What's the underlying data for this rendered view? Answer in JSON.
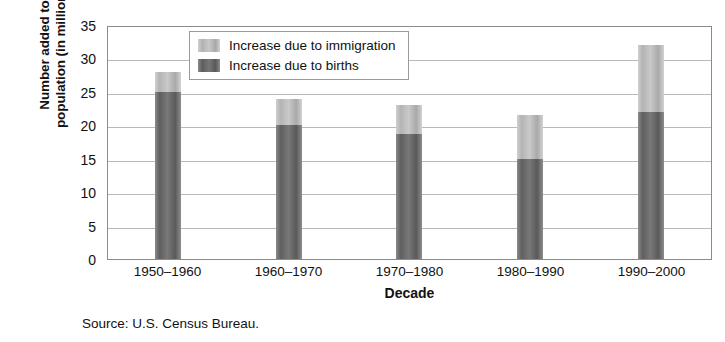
{
  "chart_data": {
    "type": "bar",
    "stacked": true,
    "categories": [
      "1950–1960",
      "1960–1970",
      "1970–1980",
      "1980–1990",
      "1990–2000"
    ],
    "series": [
      {
        "name": "Increase due to births",
        "values": [
          25,
          20,
          18.7,
          15,
          22
        ]
      },
      {
        "name": "Increase due to immigration",
        "values": [
          3,
          4,
          4.3,
          6.5,
          10
        ]
      }
    ],
    "totals": [
      28,
      24,
      23,
      21.5,
      32
    ],
    "title": "",
    "xlabel": "Decade",
    "ylabel": "Number added to population (in millions)",
    "ylabel_lines": [
      "Number added to",
      "population (in millions)"
    ],
    "ylim": [
      0,
      35
    ],
    "ytick_values": [
      0,
      5,
      10,
      15,
      20,
      25,
      30,
      35
    ],
    "ytick_labels": [
      "0",
      "5",
      "10",
      "15",
      "20",
      "25",
      "30",
      "35"
    ],
    "grid": true,
    "legend_position": "top-left-inside",
    "legend_entries": [
      {
        "label": "Increase due to immigration",
        "swatch": "light-gray"
      },
      {
        "label": "Increase due to births",
        "swatch": "dark-gray"
      }
    ],
    "colors": {
      "immigration": "#bdbdbd",
      "births": "#6e6e6e",
      "gridline": "#b9b9b9",
      "frame": "#8b8b8b",
      "background": "#ffffff",
      "text": "#111111"
    }
  },
  "caption": {
    "source": "Source: U.S. Census Bureau."
  }
}
